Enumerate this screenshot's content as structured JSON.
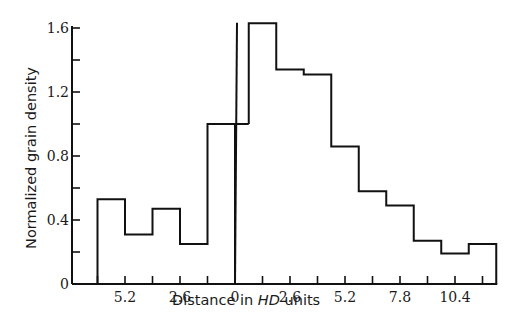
{
  "chart_data": {
    "type": "bar",
    "subtype": "step-histogram",
    "title": "",
    "xlabel": "Distance in HD units",
    "xlabel_parts": [
      "Distance in ",
      "HD",
      " units"
    ],
    "ylabel": "Normalized grain density",
    "ylim": [
      0,
      1.6
    ],
    "y_ticks": [
      "0",
      "0.4",
      "0.8",
      "1.2",
      "1.6"
    ],
    "y_tick_values": [
      0,
      0.4,
      0.8,
      1.2,
      1.6
    ],
    "y_minor_ticks": [
      0.2,
      0.6,
      1.0,
      1.4
    ],
    "x_tick_labels": [
      "5.2",
      "2.6",
      "0",
      "2.6",
      "5.2",
      "7.8",
      "10.4"
    ],
    "x_tick_positions": [
      -5.2,
      -2.6,
      0,
      2.6,
      5.2,
      7.8,
      10.4
    ],
    "xlim": [
      -7.8,
      12.35
    ],
    "bin_width": 1.3,
    "bins": [
      {
        "x0": -6.5,
        "x1": -5.2,
        "value": 0.53
      },
      {
        "x0": -5.2,
        "x1": -3.9,
        "value": 0.31
      },
      {
        "x0": -3.9,
        "x1": -2.6,
        "value": 0.47
      },
      {
        "x0": -2.6,
        "x1": -1.3,
        "value": 0.25
      },
      {
        "x0": -1.3,
        "x1": 0.0,
        "value": 1.0
      },
      {
        "x0": 0.65,
        "x1": 1.95,
        "value": 1.63
      },
      {
        "x0": 1.95,
        "x1": 3.25,
        "value": 1.34
      },
      {
        "x0": 3.25,
        "x1": 4.55,
        "value": 1.31
      },
      {
        "x0": 4.55,
        "x1": 5.85,
        "value": 0.86
      },
      {
        "x0": 5.85,
        "x1": 7.15,
        "value": 0.58
      },
      {
        "x0": 7.15,
        "x1": 8.45,
        "value": 0.49
      },
      {
        "x0": 8.45,
        "x1": 9.75,
        "value": 0.27
      },
      {
        "x0": 9.75,
        "x1": 11.05,
        "value": 0.19
      },
      {
        "x0": 11.05,
        "x1": 12.35,
        "value": 0.25
      }
    ],
    "categories": [
      "-5.85",
      "-4.55",
      "-3.25",
      "-1.95",
      "-0.65",
      "1.3",
      "2.6",
      "3.9",
      "5.2",
      "6.5",
      "7.8",
      "9.1",
      "10.4",
      "11.7"
    ],
    "values": [
      0.53,
      0.31,
      0.47,
      0.25,
      1.0,
      1.63,
      1.34,
      1.31,
      0.86,
      0.58,
      0.49,
      0.27,
      0.19,
      0.25
    ],
    "annotations": [
      {
        "type": "vertical-line",
        "x": 0,
        "y_top": 1.62,
        "label": "origin marker"
      }
    ],
    "grid": false,
    "legend": null
  }
}
